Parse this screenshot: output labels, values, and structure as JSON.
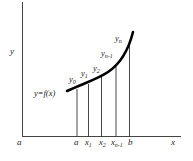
{
  "diagram": {
    "type": "riemann-ordinates",
    "axis_labels": {
      "x": "x",
      "y": "y",
      "origin": "a"
    },
    "curve_label": "y=f(x)",
    "x_ticks": [
      {
        "base": "a",
        "sub": ""
      },
      {
        "base": "x",
        "sub": "1"
      },
      {
        "base": "x",
        "sub": "2"
      },
      {
        "base": "x",
        "sub": "n-1"
      },
      {
        "base": "b",
        "sub": ""
      }
    ],
    "ordinates": [
      {
        "base": "y",
        "sub": "0"
      },
      {
        "base": "y",
        "sub": "1"
      },
      {
        "base": "y",
        "sub": "2"
      },
      {
        "base": "y",
        "sub": "n-1"
      },
      {
        "base": "y",
        "sub": "n"
      }
    ],
    "colors": {
      "curve": "#000000",
      "axis": "#444444",
      "text": "#222222"
    }
  }
}
